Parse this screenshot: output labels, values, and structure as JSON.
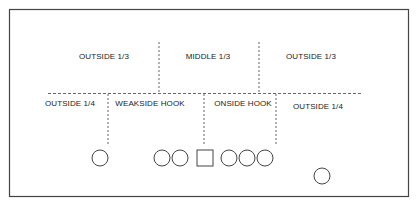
{
  "diagram": {
    "title": "",
    "colors": {
      "line": "#555555",
      "text": "#222222",
      "frame": "#444444",
      "background": "#ffffff"
    },
    "deep_zones": [
      {
        "label": "OUTSIDE 1/3",
        "x": 104,
        "y": 52
      },
      {
        "label": "MIDDLE 1/3",
        "x": 208,
        "y": 52
      },
      {
        "label": "OUTSIDE 1/3",
        "x": 311,
        "y": 52
      }
    ],
    "underneath_zones": [
      {
        "label": "OUTSIDE 1/4",
        "x": 70,
        "y": 99
      },
      {
        "label": "WEAKSIDE HOOK",
        "x": 150,
        "y": 99
      },
      {
        "label": "ONSIDE HOOK",
        "x": 243,
        "y": 99
      },
      {
        "label": "OUTSIDE 1/4",
        "x": 318,
        "y": 102
      }
    ],
    "players": [
      {
        "shape": "circle",
        "role": "receiver",
        "x": 100,
        "y": 158
      },
      {
        "shape": "circle",
        "role": "lineman",
        "x": 162,
        "y": 158
      },
      {
        "shape": "circle",
        "role": "lineman",
        "x": 180,
        "y": 158
      },
      {
        "shape": "square",
        "role": "center",
        "x": 205,
        "y": 158
      },
      {
        "shape": "circle",
        "role": "lineman",
        "x": 229,
        "y": 158
      },
      {
        "shape": "circle",
        "role": "lineman",
        "x": 247,
        "y": 158
      },
      {
        "shape": "circle",
        "role": "end",
        "x": 265,
        "y": 158
      },
      {
        "shape": "circle",
        "role": "receiver",
        "x": 322,
        "y": 176
      }
    ]
  }
}
